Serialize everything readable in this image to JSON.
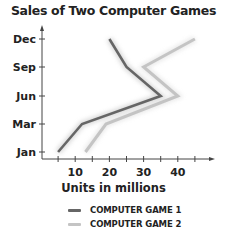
{
  "chart_data": {
    "type": "line",
    "title": "Sales of Two Computer Games",
    "xlabel": "Units in millions",
    "ylabel": "",
    "orientation": "horizontal-values (months on y-axis, units on x-axis)",
    "categories": [
      "Jan",
      "Mar",
      "Jun",
      "Sep",
      "Dec"
    ],
    "x_ticks": [
      10,
      20,
      30,
      40
    ],
    "x_minor_ticks": [
      5,
      10,
      15,
      20,
      25,
      30,
      35,
      40,
      45
    ],
    "xlim": [
      0,
      50
    ],
    "grid": false,
    "legend_position": "bottom",
    "series": [
      {
        "name": "COMPUTER GAME 1",
        "color": "#666666",
        "values": [
          5,
          12,
          35,
          25,
          20
        ]
      },
      {
        "name": "COMPUTER GAME 2",
        "color": "#c4c4c4",
        "values": [
          13,
          19,
          40,
          30,
          45
        ]
      }
    ]
  },
  "title": "Sales of Two Computer Games",
  "x_axis_title": "Units in millions",
  "y_tick_labels": [
    "Dec",
    "Sep",
    "Jun",
    "Mar",
    "Jan"
  ],
  "x_tick_labels": [
    "10",
    "20",
    "30",
    "40"
  ],
  "legend": [
    {
      "label": "COMPUTER GAME 1",
      "color": "#666666"
    },
    {
      "label": "COMPUTER GAME 2",
      "color": "#c4c4c4"
    }
  ]
}
